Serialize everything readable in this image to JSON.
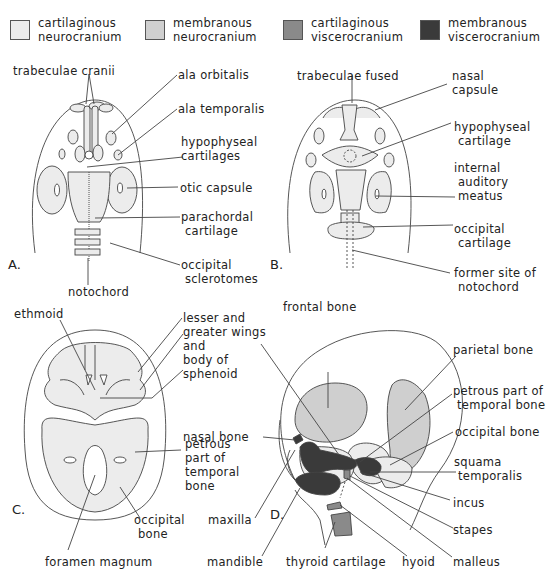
{
  "legend": [
    {
      "label": "cartilaginous\nneurocranium",
      "color": "#ececec"
    },
    {
      "label": "membranous\nneurocranium",
      "color": "#cfcfcf"
    },
    {
      "label": "cartilaginous\nviscerocranium",
      "color": "#8a8a8a"
    },
    {
      "label": "membranous\nviscerocranium",
      "color": "#3a3a3a"
    }
  ],
  "colors": {
    "cart_neuro": "#ececec",
    "memb_neuro": "#cfcfcf",
    "cart_visc": "#8a8a8a",
    "memb_visc": "#3a3a3a",
    "outline": "#444444"
  },
  "panels": {
    "A": {
      "letter": "A.",
      "labels": {
        "trabeculae_cranii": "trabeculae cranii",
        "ala_orbitalis": "ala orbitalis",
        "ala_temporalis": "ala temporalis",
        "hypophyseal_cartilages": "hypophyseal\ncartilages",
        "otic_capsule": "otic capsule",
        "parachordal_cartilage": "parachordal\n cartilage",
        "occipital_sclerotomes": "occipital\n sclerotomes",
        "notochord": "notochord"
      }
    },
    "B": {
      "letter": "B.",
      "labels": {
        "trabeculae_fused": "trabeculae fused",
        "nasal_capsule": "nasal\ncapsule",
        "hypophyseal_cartilage": "hypophyseal\n cartilage",
        "internal_auditory_meatus": "internal\n auditory\n meatus",
        "occipital_cartilage": "occipital\n cartilage",
        "former_site_of_notochord": "former site of\n notochord"
      }
    },
    "C": {
      "letter": "C.",
      "labels": {
        "ethmoid": "ethmoid",
        "sphenoid": "lesser and\ngreater wings\nand\nbody of\nsphenoid",
        "petrous_part": "petrous\npart of\ntemporal\nbone",
        "occipital_bone": "occipital\n bone",
        "foramen_magnum": "foramen magnum"
      }
    },
    "D": {
      "letter": "D.",
      "labels": {
        "frontal_bone": "frontal bone",
        "parietal_bone": "parietal bone",
        "petrous_part": "petrous part of\n temporal bone",
        "occipital_bone": "occipital bone",
        "nasal_bone": "nasal bone",
        "squama_temporalis": "squama\n temporalis",
        "incus": "incus",
        "stapes": "stapes",
        "maxilla": "maxilla",
        "mandible": "mandible",
        "thyroid_cartilage": "thyroid cartilage",
        "hyoid": "hyoid",
        "malleus": "malleus"
      }
    }
  }
}
